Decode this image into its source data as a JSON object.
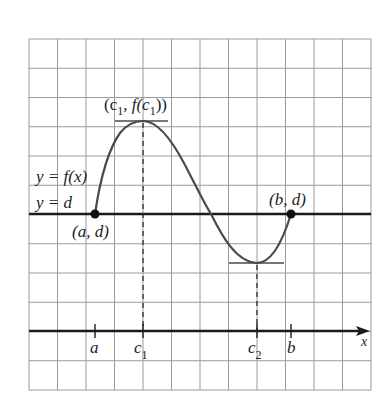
{
  "figure": {
    "colors": {
      "grid": "#9a9a9a",
      "axis": "#1a1a1a",
      "curve": "#4a4a4a",
      "background": "#ffffff"
    },
    "grid": {
      "left": 29,
      "top": 39,
      "right": 371,
      "bottom": 390,
      "cols": 12,
      "rows": 12
    },
    "labels": {
      "curve": "y = f(x)",
      "line": "y = d",
      "point_a": "(a, d)",
      "point_b": "(b, d)",
      "max_point_open": "(c",
      "max_point_sub1": "1",
      "max_point_mid": ", f(c",
      "max_point_sub2": "1",
      "max_point_close": "))",
      "tick_a": "a",
      "tick_c1": "c",
      "tick_c1_sub": "1",
      "tick_c2": "c",
      "tick_c2_sub": "2",
      "tick_b": "b",
      "x_axis": "x"
    },
    "points": {
      "a": {
        "x": 95,
        "y": 214
      },
      "b": {
        "x": 291,
        "y": 214
      },
      "c1_max": {
        "x": 143,
        "y": 121
      },
      "c2_min": {
        "x": 257,
        "y": 263
      }
    },
    "x_axis_y": 331,
    "y_d_line_y": 214,
    "curve_path": "M95,214 C100,180 108,150 120,133 C128,123 136,121 143,121 C158,121 172,140 185,165 C198,190 205,205 211,214 C222,236 236,262 257,263 C272,263 283,240 291,214"
  }
}
